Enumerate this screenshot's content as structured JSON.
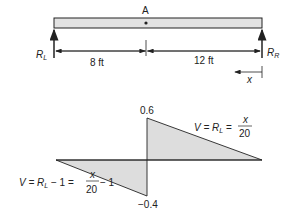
{
  "beam": {
    "point_label": "A",
    "left_reaction": "R",
    "left_reaction_sub": "L",
    "right_reaction": "R",
    "right_reaction_sub": "R",
    "left_span": "8 ft",
    "right_span": "12 ft",
    "x_label": "x"
  },
  "shear_diagram": {
    "max_value": "0.6",
    "min_value": "−0.4",
    "right_eq": {
      "lhs": "V = R",
      "sub": "L",
      "eq": " = ",
      "num": "x",
      "den": "20"
    },
    "left_eq": {
      "lhs": "V = R",
      "sub": "L",
      "mid": " − 1 = ",
      "num": "x",
      "den": "20",
      "tail": " − 1"
    }
  },
  "colors": {
    "fill": "#dddddd",
    "line": "#222222"
  }
}
